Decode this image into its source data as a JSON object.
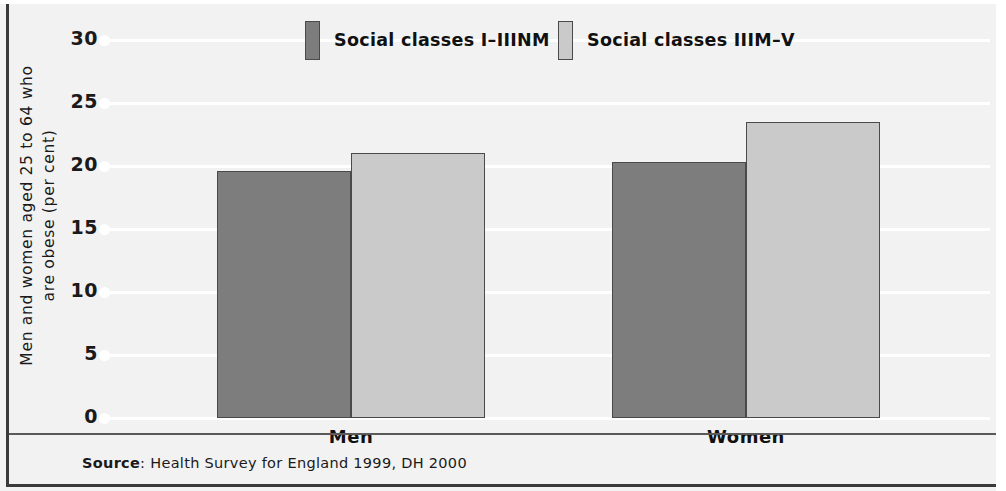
{
  "chart_data": {
    "type": "bar",
    "title": "",
    "xlabel": "",
    "ylabel": "Men and women aged 25 to 64 who are obese (per cent)",
    "ylabel_lines": [
      "Men and women aged 25 to 64 who",
      "are obese (per cent)"
    ],
    "categories": [
      "Men",
      "Women"
    ],
    "ylim": [
      0,
      30
    ],
    "yticks": [
      30,
      25,
      20,
      15,
      10,
      5,
      0
    ],
    "grid": true,
    "legend_position": "top-center",
    "series": [
      {
        "name": "Social classes I–IIINM",
        "color": "#7d7d7d",
        "values": [
          19.6,
          20.3
        ]
      },
      {
        "name": "Social classes IIIM–V",
        "color": "#cacaca",
        "values": [
          21.0,
          23.5
        ]
      }
    ]
  },
  "legend": {
    "entries": [
      {
        "label": "Social classes I–IIINM"
      },
      {
        "label": "Social classes IIIM–V"
      }
    ]
  },
  "source": {
    "prefix": "Source",
    "separator": ": ",
    "text": "Health Survey for England 1999, DH 2000"
  },
  "colors": {
    "series_dark": "#7d7d7d",
    "series_light": "#cacaca",
    "background": "#f2f2f2",
    "gridline": "#ffffff",
    "frame": "#3a3a3a"
  }
}
